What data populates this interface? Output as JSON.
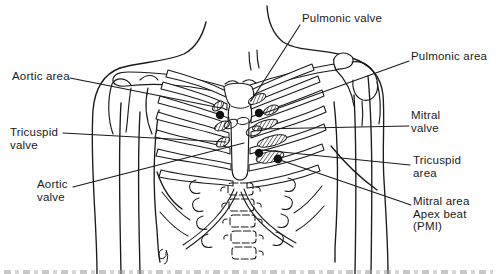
{
  "diagram": {
    "colors": {
      "ink": "#1a1a1a",
      "paper": "#ffffff",
      "marker_dot": "#111111"
    }
  },
  "labels": {
    "pulmonic_valve": {
      "lines": [
        "Pulmonic valve"
      ]
    },
    "pulmonic_area": {
      "lines": [
        "Pulmonic area"
      ]
    },
    "aortic_area": {
      "lines": [
        "Aortic area"
      ]
    },
    "mitral_valve": {
      "lines": [
        "Mitral",
        "valve"
      ]
    },
    "tricuspid_valve": {
      "lines": [
        "Tricuspid",
        "valve"
      ]
    },
    "tricuspid_area": {
      "lines": [
        "Tricuspid",
        "area"
      ]
    },
    "aortic_valve": {
      "lines": [
        "Aortic",
        "valve"
      ]
    },
    "mitral_area": {
      "lines": [
        "Mitral area",
        "Apex beat",
        "(PMI)"
      ]
    }
  }
}
